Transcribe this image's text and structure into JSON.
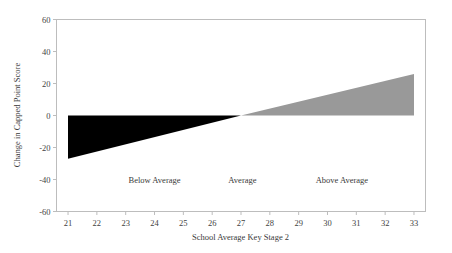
{
  "chart_data": {
    "type": "area",
    "title": "",
    "subtitle": "",
    "xlabel": "School Average Key Stage 2",
    "ylabel": "Change in Capped Point Score",
    "xlim": [
      20.6,
      33.4
    ],
    "ylim": [
      -60,
      60
    ],
    "grid": false,
    "legend_position": "none",
    "x_ticks": [
      21,
      22,
      23,
      24,
      25,
      26,
      27,
      28,
      29,
      30,
      31,
      32,
      33
    ],
    "y_ticks": [
      60,
      40,
      20,
      0,
      -20,
      -40,
      -60
    ],
    "x_tick_labels": [
      "21",
      "22",
      "23",
      "24",
      "25",
      "26",
      "27",
      "28",
      "29",
      "30",
      "31",
      "32",
      "33"
    ],
    "y_tick_labels": [
      "60",
      "40",
      "20",
      "0",
      "-20",
      "-40",
      "-60"
    ],
    "series": [
      {
        "name": "Below Average wedge",
        "fill_color": "#000000",
        "x": [
          21,
          27,
          21
        ],
        "values": [
          0,
          0,
          -27
        ],
        "description": "Solid black triangle spanning KS2 21 to 27, widening downward from 0 at x=27 to -27 at x=21"
      },
      {
        "name": "Above Average wedge",
        "fill_color": "#999999",
        "x": [
          27,
          33,
          33
        ],
        "values": [
          0,
          0,
          26
        ],
        "description": "Solid grey triangle spanning KS2 27 to 33, widening upward from 0 at x=27 to +26 at x=33"
      }
    ],
    "annotations": [
      {
        "text": "Below Average",
        "x": 24.0,
        "y": -40
      },
      {
        "text": "Average",
        "x": 27.05,
        "y": -40
      },
      {
        "text": "Above Average",
        "x": 30.5,
        "y": -40
      }
    ],
    "colors": {
      "background": "#ffffff",
      "frame": "#bdbdbd",
      "black_wedge": "#000000",
      "grey_wedge": "#999999",
      "text": "#3a3a3a"
    }
  }
}
